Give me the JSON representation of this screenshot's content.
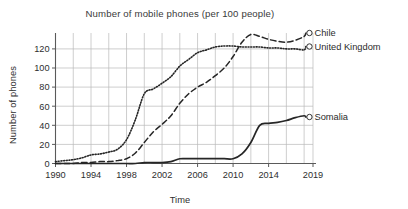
{
  "chart_data": {
    "type": "line",
    "title": "Number of mobile phones (per 100 people)",
    "xlabel": "Time",
    "ylabel": "Number of phones",
    "xlim": [
      1990,
      2019
    ],
    "ylim": [
      0,
      140
    ],
    "xticks": [
      "1990",
      "1994",
      "1998",
      "2002",
      "2006",
      "2010",
      "2014",
      "2019"
    ],
    "xtick_values": [
      1990,
      1994,
      1998,
      2002,
      2006,
      2010,
      2014,
      2019
    ],
    "yticks": [
      "0",
      "20",
      "40",
      "60",
      "80",
      "100",
      "120"
    ],
    "ytick_values": [
      0,
      20,
      40,
      60,
      80,
      100,
      120
    ],
    "grid": "vertical-and-horizontal gridlines every 2 years and every 20 phones",
    "legend_position": "right of plot, inline end-of-line labels with open circle markers",
    "x": [
      1990,
      1991,
      1992,
      1993,
      1994,
      1995,
      1996,
      1997,
      1998,
      1999,
      2000,
      2001,
      2002,
      2003,
      2004,
      2005,
      2006,
      2007,
      2008,
      2009,
      2010,
      2011,
      2012,
      2013,
      2014,
      2015,
      2016,
      2017,
      2018
    ],
    "series": [
      {
        "name": "Chile",
        "line_style": "dashed",
        "marker": "open-circle-at-end",
        "color": "#262626",
        "values": [
          0,
          0,
          0,
          1,
          1,
          2,
          2,
          3,
          5,
          11,
          22,
          33,
          41,
          50,
          63,
          73,
          80,
          85,
          92,
          100,
          112,
          127,
          135,
          133,
          130,
          128,
          127,
          129,
          133
        ]
      },
      {
        "name": "United Kingdom",
        "line_style": "dotted",
        "marker": "open-circle-at-end",
        "color": "#262626",
        "values": [
          2,
          3,
          4,
          6,
          9,
          10,
          12,
          15,
          25,
          46,
          73,
          78,
          84,
          91,
          102,
          109,
          116,
          119,
          122,
          123,
          123,
          122,
          122,
          122,
          121,
          121,
          120,
          120,
          119
        ]
      },
      {
        "name": "Somalia",
        "line_style": "solid",
        "marker": "open-circle-at-end",
        "color": "#262626",
        "values": [
          0,
          0,
          0,
          0,
          0,
          0,
          0,
          0,
          0,
          0,
          1,
          1,
          1,
          2,
          5,
          5,
          5,
          5,
          5,
          5,
          5,
          10,
          22,
          40,
          42,
          43,
          45,
          48,
          50
        ]
      }
    ],
    "series_labels": [
      "Chile",
      "United Kingdom",
      "Somalia"
    ]
  }
}
